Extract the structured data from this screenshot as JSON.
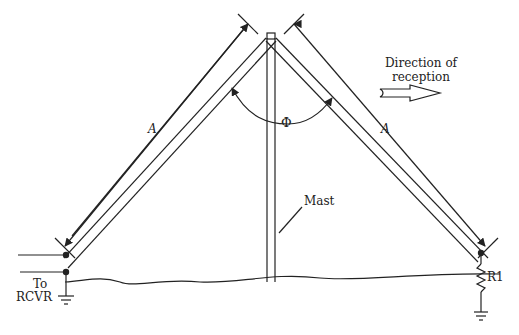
{
  "diagram": {
    "type": "inverted-V antenna",
    "labels": {
      "direction": "Direction of reception",
      "direction_line1": "Direction of",
      "direction_line2": "reception",
      "leg_left": "A",
      "leg_right": "A",
      "angle": "Φ",
      "mast": "Mast",
      "to": "To",
      "rcvr": "RCVR",
      "resistor": "R1"
    },
    "colors": {
      "stroke": "#222222",
      "background": "#ffffff"
    }
  }
}
